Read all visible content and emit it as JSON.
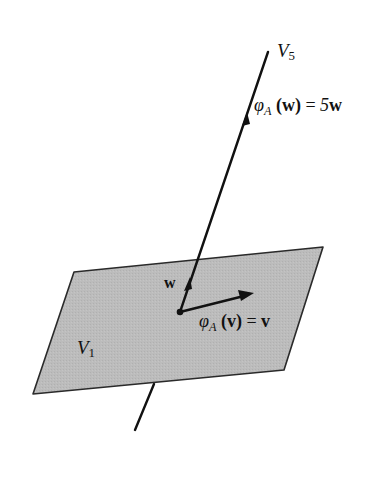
{
  "diagram": {
    "type": "linear-algebra-eigenspaces",
    "colors": {
      "plane_fill": "#b9b9b9",
      "plane_edge": "#2a2a2a",
      "line": "#111111",
      "background": "#ffffff"
    },
    "labels": {
      "v5": {
        "main": "V",
        "sub": "5"
      },
      "v1": {
        "main": "V",
        "sub": "1"
      },
      "w_vec": "w",
      "phi_w": {
        "phi": "φ",
        "sub": "A",
        "arg": "(w)",
        "eq": " = ",
        "rhs_coef": "5",
        "rhs_vec": "w"
      },
      "phi_v": {
        "phi": "φ",
        "sub": "A",
        "arg": "(v)",
        "eq": " = ",
        "rhs_vec": "v"
      }
    },
    "geometry": {
      "plane": [
        [
          74,
          272
        ],
        [
          323,
          247
        ],
        [
          284,
          370
        ],
        [
          33,
          394
        ]
      ],
      "line_top": [
        268,
        52
      ],
      "line_bottom": [
        135,
        430
      ],
      "origin": [
        180,
        312
      ],
      "v_tip": [
        252,
        294
      ],
      "w_tip": [
        190,
        281
      ]
    }
  }
}
